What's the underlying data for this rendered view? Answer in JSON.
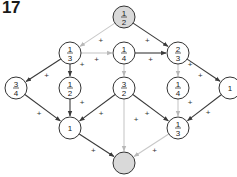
{
  "problem_number": "17",
  "colors": {
    "dark_edge": "#3a3a3a",
    "light_edge": "#c8c8c8",
    "shaded_node": "#d9d9d9",
    "node_stroke": "#333333"
  },
  "nodes": [
    {
      "id": "n0",
      "num": "1",
      "den": "2",
      "x": 124,
      "y": 17,
      "shaded": true
    },
    {
      "id": "n1",
      "num": "1",
      "den": "3",
      "x": 70,
      "y": 53,
      "shaded": false
    },
    {
      "id": "n2",
      "num": "1",
      "den": "4",
      "x": 124,
      "y": 53,
      "shaded": false
    },
    {
      "id": "n3",
      "num": "2",
      "den": "3",
      "x": 178,
      "y": 53,
      "shaded": false
    },
    {
      "id": "n4",
      "num": "3",
      "den": "4",
      "x": 16,
      "y": 88,
      "shaded": false
    },
    {
      "id": "n5",
      "num": "1",
      "den": "2",
      "x": 70,
      "y": 88,
      "shaded": false
    },
    {
      "id": "n6",
      "num": "3",
      "den": "2",
      "x": 124,
      "y": 88,
      "shaded": false
    },
    {
      "id": "n7",
      "num": "1",
      "den": "4",
      "x": 178,
      "y": 88,
      "shaded": false
    },
    {
      "id": "n8",
      "whole": "1",
      "x": 230,
      "y": 88,
      "shaded": false
    },
    {
      "id": "n9",
      "whole": "1",
      "x": 70,
      "y": 128,
      "shaded": false
    },
    {
      "id": "n10",
      "num": "1",
      "den": "3",
      "x": 178,
      "y": 128,
      "shaded": false
    },
    {
      "id": "n11",
      "x": 124,
      "y": 163,
      "shaded": true,
      "empty": true
    }
  ],
  "edges": [
    {
      "from": "n0",
      "to": "n1",
      "light": true,
      "op": "+"
    },
    {
      "from": "n0",
      "to": "n3",
      "light": false,
      "op": "+"
    },
    {
      "from": "n1",
      "to": "n2",
      "light": true,
      "op": "+"
    },
    {
      "from": "n2",
      "to": "n3",
      "light": false,
      "op": "+"
    },
    {
      "from": "n1",
      "to": "n4",
      "light": false,
      "op": "+"
    },
    {
      "from": "n1",
      "to": "n5",
      "light": false,
      "op": "+"
    },
    {
      "from": "n2",
      "to": "n6",
      "light": true,
      "op": ""
    },
    {
      "from": "n3",
      "to": "n7",
      "light": true,
      "op": "+"
    },
    {
      "from": "n3",
      "to": "n8",
      "light": false,
      "op": "+"
    },
    {
      "from": "n4",
      "to": "n9",
      "light": false,
      "op": "+"
    },
    {
      "from": "n5",
      "to": "n9",
      "light": false,
      "op": "+"
    },
    {
      "from": "n6",
      "to": "n9",
      "light": false,
      "op": "+"
    },
    {
      "from": "n6",
      "to": "n10",
      "light": false,
      "op": "+"
    },
    {
      "from": "n7",
      "to": "n10",
      "light": true,
      "op": "+"
    },
    {
      "from": "n8",
      "to": "n10",
      "light": false,
      "op": "+"
    },
    {
      "from": "n9",
      "to": "n11",
      "light": false,
      "op": "+"
    },
    {
      "from": "n6",
      "to": "n11",
      "light": true,
      "op": "+"
    },
    {
      "from": "n10",
      "to": "n11",
      "light": true,
      "op": "+"
    }
  ]
}
